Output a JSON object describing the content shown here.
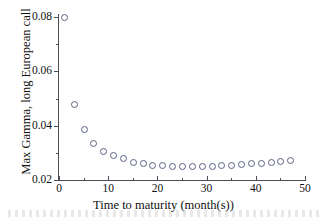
{
  "chart_data": {
    "type": "scatter",
    "title": "",
    "xlabel": "Time to maturity (month(s))",
    "ylabel": "Max Gamma, long European call",
    "xlim": [
      0,
      50
    ],
    "ylim": [
      0.02,
      0.08
    ],
    "grid": false,
    "legend": null,
    "marker": "open-circle",
    "marker_color": "#5a5f84",
    "x_ticks": [
      0,
      10,
      20,
      30,
      40,
      50
    ],
    "x_tick_labels": [
      "0",
      "10",
      "20",
      "30",
      "40",
      "50"
    ],
    "x_minor_ticks": [
      5,
      15,
      25,
      35,
      45
    ],
    "y_ticks": [
      0.02,
      0.04,
      0.06,
      0.08
    ],
    "y_tick_labels": [
      "0.02",
      "0.04",
      "0.06",
      "0.08"
    ],
    "y_minor_ticks": [
      0.03,
      0.05,
      0.07
    ],
    "x": [
      1,
      3,
      5,
      7,
      9,
      11,
      13,
      15,
      17,
      19,
      21,
      23,
      25,
      27,
      29,
      31,
      33,
      35,
      37,
      39,
      41,
      43,
      45,
      47
    ],
    "values": [
      0.0801,
      0.0481,
      0.0387,
      0.0338,
      0.0308,
      0.0291,
      0.0281,
      0.0268,
      0.0261,
      0.0256,
      0.0254,
      0.0253,
      0.0253,
      0.0253,
      0.0253,
      0.0253,
      0.0254,
      0.0256,
      0.0259,
      0.0261,
      0.0263,
      0.0267,
      0.0271,
      0.0274
    ]
  },
  "axes": {
    "x_title": "Time to maturity (month(s))",
    "y_title": "Max Gamma, long European call"
  }
}
